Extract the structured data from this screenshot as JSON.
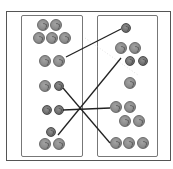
{
  "diagram": {
    "type": "coin-matching-worksheet",
    "colors": {
      "frame": "#555555",
      "panel": "#777777",
      "line": "#222222",
      "coin": "#8b8b8b"
    },
    "left_groups": [
      {
        "id": "L1",
        "label": "group of 5 coins",
        "coins": [
          {
            "x": 37,
            "y": 19,
            "size": "big"
          },
          {
            "x": 50,
            "y": 19,
            "size": "big"
          },
          {
            "x": 33,
            "y": 32,
            "size": "big"
          },
          {
            "x": 46,
            "y": 32,
            "size": "big"
          },
          {
            "x": 59,
            "y": 32,
            "size": "big"
          }
        ]
      },
      {
        "id": "L2",
        "label": "group of 2 coins",
        "coins": [
          {
            "x": 39,
            "y": 55,
            "size": "big"
          },
          {
            "x": 53,
            "y": 55,
            "size": "big"
          }
        ]
      },
      {
        "id": "L3",
        "label": "group of 2 coins",
        "coins": [
          {
            "x": 39,
            "y": 80,
            "size": "big"
          },
          {
            "x": 54,
            "y": 81,
            "size": "small"
          }
        ]
      },
      {
        "id": "L4",
        "label": "group of 2 coins",
        "coins": [
          {
            "x": 42,
            "y": 105,
            "size": "small"
          },
          {
            "x": 54,
            "y": 105,
            "size": "small"
          }
        ]
      },
      {
        "id": "L5",
        "label": "group of 3 coins",
        "coins": [
          {
            "x": 46,
            "y": 127,
            "size": "small"
          },
          {
            "x": 39,
            "y": 138,
            "size": "big"
          },
          {
            "x": 53,
            "y": 138,
            "size": "big"
          }
        ]
      }
    ],
    "right_groups": [
      {
        "id": "R1",
        "label": "group of 1 coin",
        "coins": [
          {
            "x": 121,
            "y": 23,
            "size": "small"
          }
        ]
      },
      {
        "id": "R2",
        "label": "group of 4 coins",
        "coins": [
          {
            "x": 115,
            "y": 42,
            "size": "big"
          },
          {
            "x": 129,
            "y": 42,
            "size": "big"
          },
          {
            "x": 125,
            "y": 56,
            "size": "small"
          },
          {
            "x": 138,
            "y": 56,
            "size": "small"
          }
        ]
      },
      {
        "id": "R3",
        "label": "group of 1 coin",
        "coins": [
          {
            "x": 124,
            "y": 77,
            "size": "big"
          }
        ]
      },
      {
        "id": "R4",
        "label": "group of 4 coins",
        "coins": [
          {
            "x": 110,
            "y": 101,
            "size": "big"
          },
          {
            "x": 124,
            "y": 101,
            "size": "big"
          },
          {
            "x": 119,
            "y": 115,
            "size": "big"
          },
          {
            "x": 133,
            "y": 115,
            "size": "big"
          }
        ]
      },
      {
        "id": "R5",
        "label": "group of 3 coins",
        "coins": [
          {
            "x": 110,
            "y": 137,
            "size": "big"
          },
          {
            "x": 123,
            "y": 137,
            "size": "big"
          },
          {
            "x": 137,
            "y": 137,
            "size": "big"
          }
        ]
      }
    ],
    "connections": [
      {
        "from": "L2",
        "to": "R1",
        "x1": 66,
        "y1": 57,
        "x2": 121,
        "y2": 29
      },
      {
        "from": "L5",
        "to": "R2",
        "x1": 58,
        "y1": 135,
        "x2": 121,
        "y2": 58
      },
      {
        "from": "L3",
        "to": "R5",
        "x1": 63,
        "y1": 88,
        "x2": 110,
        "y2": 143
      },
      {
        "from": "L4",
        "to": "R4",
        "x1": 63,
        "y1": 110,
        "x2": 110,
        "y2": 108
      }
    ]
  }
}
